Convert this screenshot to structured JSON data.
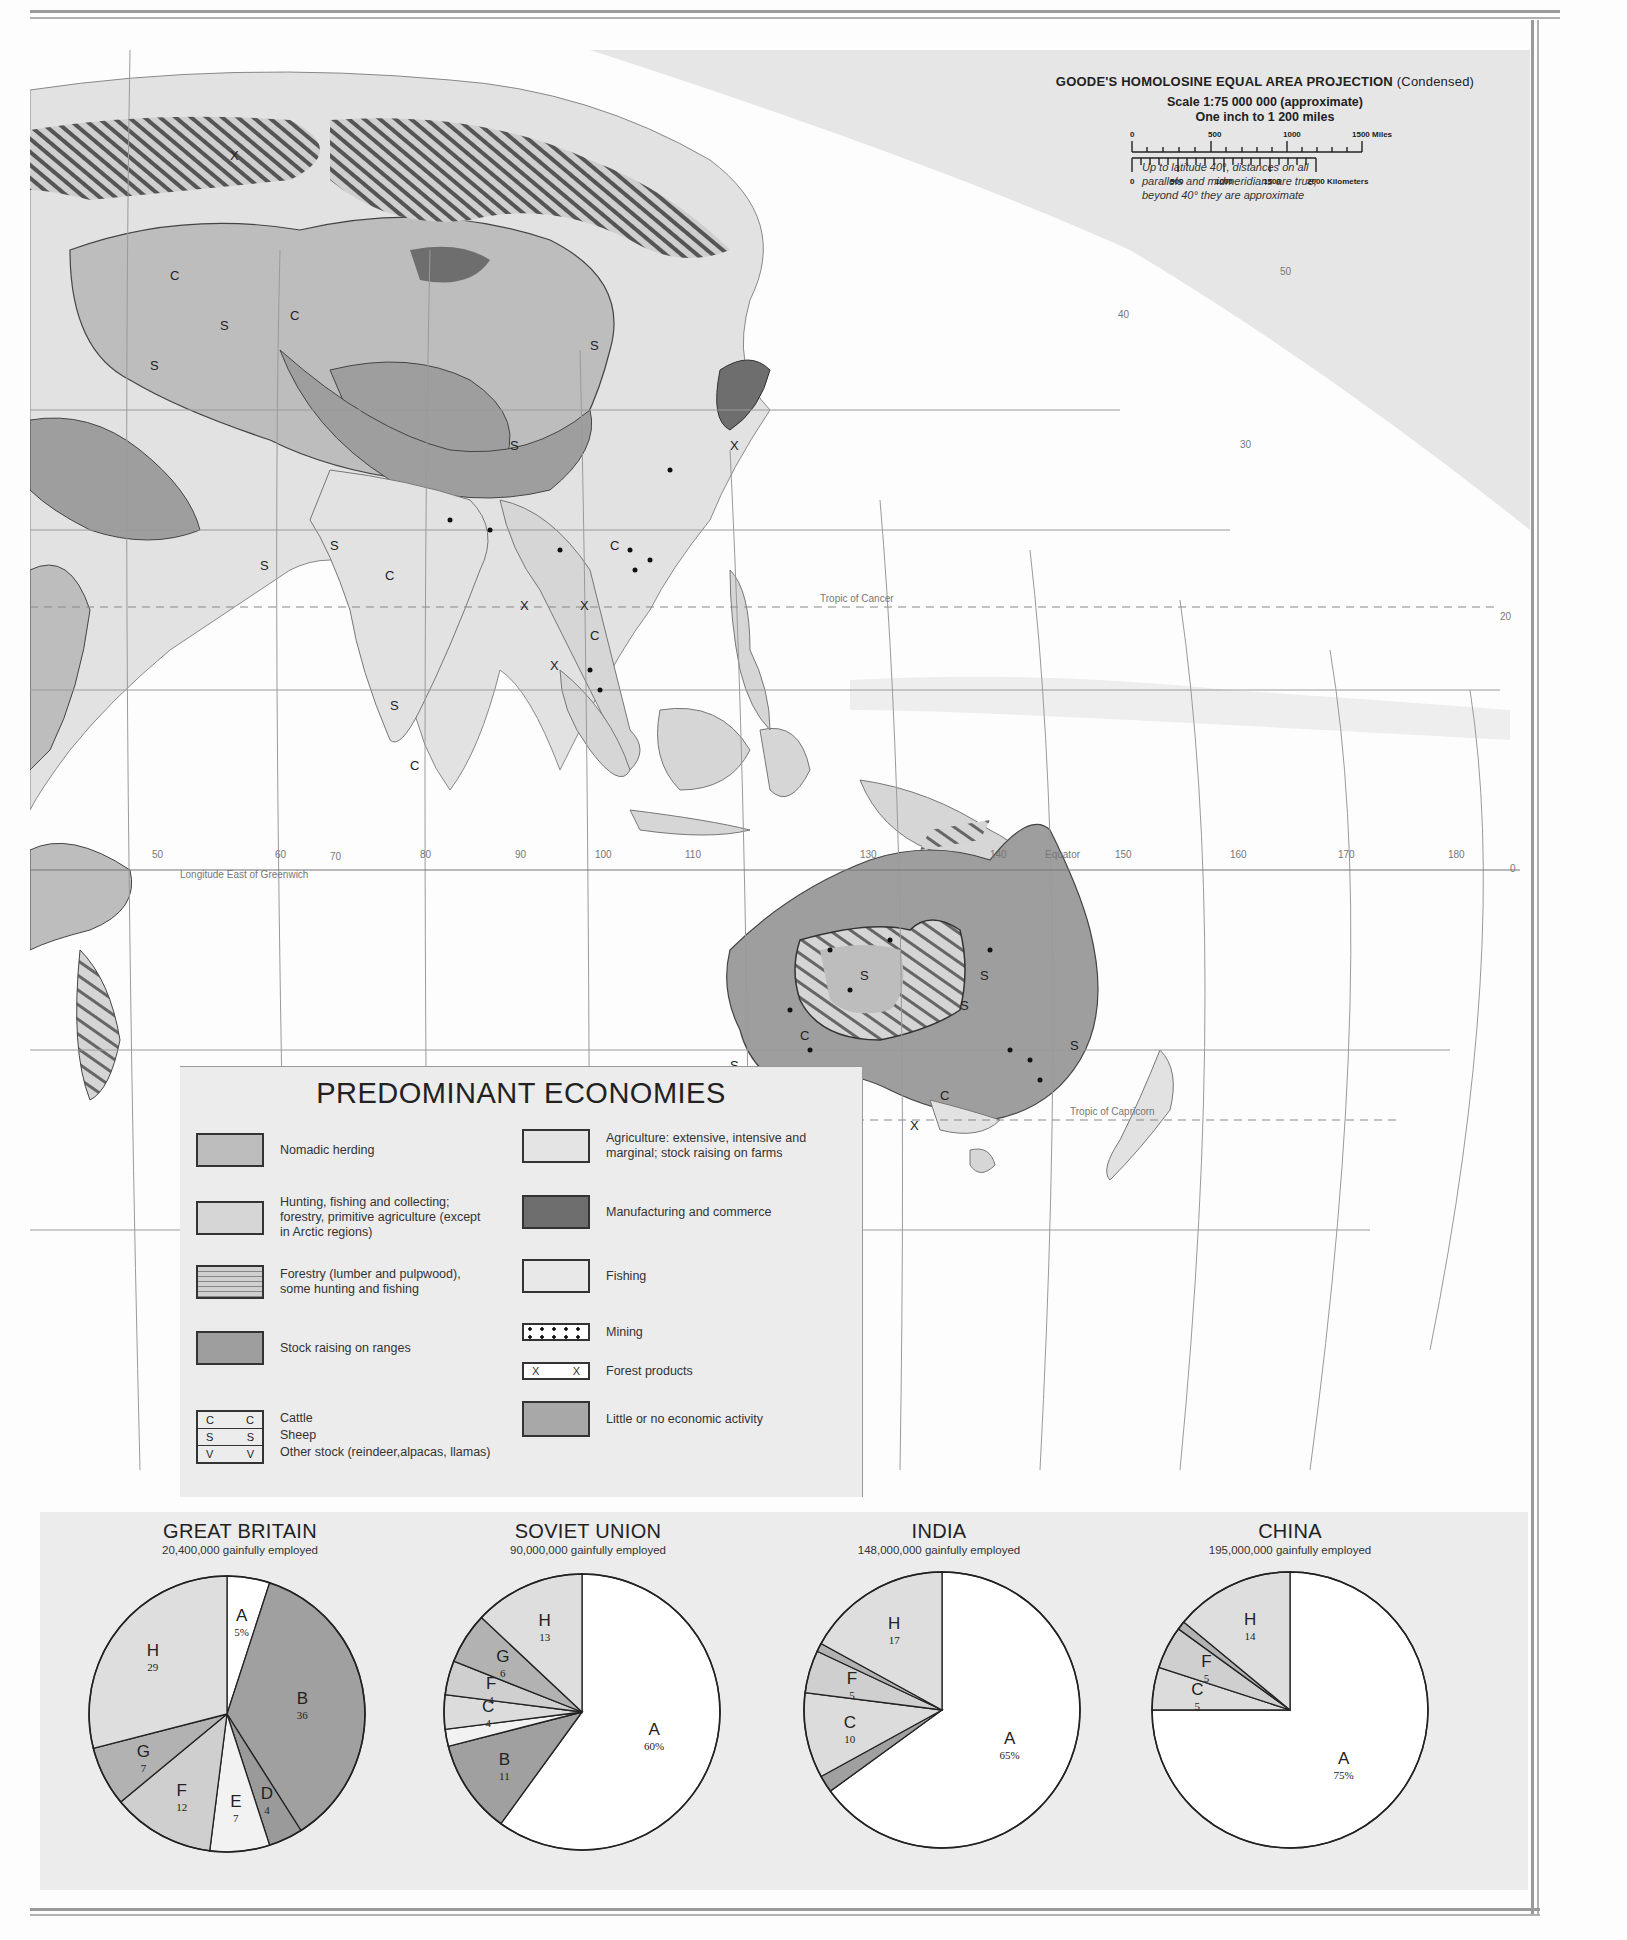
{
  "map": {
    "title": "PREDOMINANT ECONOMIES",
    "projection": {
      "name": "GOODE'S HOMOLOSINE EQUAL AREA PROJECTION",
      "variant": "(Condensed)",
      "scale": "Scale 1:75 000 000 (approximate)",
      "inch": "One inch to 1 200 miles",
      "miles_ticks": [
        "0",
        "500",
        "1000",
        "1500 Miles"
      ],
      "km_ticks": [
        "0",
        "500",
        "1000",
        "1500",
        "2000 Kilometers"
      ],
      "note_lines": [
        "Up to latitude 40°, distances on all",
        "parallels and midmeridians are true;",
        "beyond 40° they are approximate"
      ]
    },
    "grid_labels": {
      "longitude_caption": "Longitude East of Greenwich",
      "longitudes": [
        "40",
        "50",
        "60",
        "70",
        "80",
        "90",
        "100",
        "110",
        "120",
        "130",
        "140",
        "150",
        "160",
        "170",
        "180"
      ],
      "latitudes_right": [
        "50",
        "40",
        "30",
        "20",
        "10",
        "0",
        "10",
        "20",
        "30",
        "40",
        "50"
      ],
      "lat_small": [
        "70",
        "60",
        "50",
        "10"
      ],
      "equator": "Equator",
      "tropic_cancer": "Tropic of Cancer",
      "tropic_capricorn": "Tropic of Capricorn"
    },
    "symbols": {
      "cattle": "C",
      "sheep": "S",
      "other_stock": "V",
      "forest": "X"
    }
  },
  "legend": {
    "title": "PREDOMINANT ECONOMIES",
    "left": [
      {
        "label": "Nomadic herding",
        "fill": "#bdbdbd",
        "pattern": "solid"
      },
      {
        "label": "Hunting, fishing and collecting; forestry, primitive agriculture (except in Arctic regions)",
        "fill": "#d6d6d6",
        "pattern": "solid"
      },
      {
        "label": "Forestry (lumber and pulpwood), some hunting and fishing",
        "fill": "#cfcfcf",
        "pattern": "hlines"
      },
      {
        "label": "Stock raising on ranges",
        "fill": "#9e9e9e",
        "pattern": "solid"
      }
    ],
    "right": [
      {
        "label": "Agriculture: extensive, intensive and marginal; stock raising on farms",
        "fill": "#e4e4e4",
        "pattern": "solid"
      },
      {
        "label": "Manufacturing and commerce",
        "fill": "#6e6e6e",
        "pattern": "solid"
      },
      {
        "label": "Fishing",
        "fill": "#e8e8e8",
        "pattern": "solid"
      },
      {
        "label": "Mining",
        "fill": "#ffffff",
        "pattern": "dots"
      },
      {
        "label": "Forest products",
        "fill": "#ffffff",
        "pattern": "xx"
      },
      {
        "label": "Little or no economic activity",
        "fill": "#a8a8a8",
        "pattern": "solid"
      }
    ],
    "stock": [
      {
        "symbol": "C",
        "label": "Cattle"
      },
      {
        "symbol": "S",
        "label": "Sheep"
      },
      {
        "symbol": "V",
        "label": "Other stock (reindeer,alpacas, llamas)"
      }
    ]
  },
  "chart_data": [
    {
      "type": "pie",
      "title": "GREAT BRITAIN",
      "subtitle": "20,400,000 gainfully employed",
      "categories": [
        "A",
        "B",
        "D",
        "E",
        "F",
        "G",
        "H"
      ],
      "values": [
        5,
        36,
        4,
        7,
        12,
        7,
        29
      ],
      "labels": [
        "A 5%",
        "B 36",
        "D 4",
        "E 7",
        "F 12",
        "G 7",
        "H 29"
      ]
    },
    {
      "type": "pie",
      "title": "SOVIET UNION",
      "subtitle": "90,000,000 gainfully employed",
      "categories": [
        "A",
        "B",
        "E",
        "C",
        "D",
        "F",
        "G",
        "H"
      ],
      "values": [
        60,
        11,
        2,
        4,
        0,
        4,
        6,
        13
      ],
      "labels": [
        "A 60%",
        "B 11",
        "E 2",
        "C 4",
        "",
        "F 4",
        "G 6",
        "H 13"
      ]
    },
    {
      "type": "pie",
      "title": "INDIA",
      "subtitle": "148,000,000 gainfully employed",
      "categories": [
        "A",
        "B",
        "C",
        "F",
        "G",
        "H"
      ],
      "values": [
        65,
        2,
        10,
        5,
        1,
        17
      ],
      "labels": [
        "A 65%",
        "B 2",
        "C 10",
        "F 5",
        "G 1",
        "H 17"
      ]
    },
    {
      "type": "pie",
      "title": "CHINA",
      "subtitle": "195,000,000 gainfully employed",
      "categories": [
        "A",
        "C",
        "F",
        "G",
        "H"
      ],
      "values": [
        75,
        5,
        5,
        1,
        14
      ],
      "labels": [
        "A 75%",
        "C 5",
        "F 5",
        "G 1",
        "H 14"
      ]
    }
  ],
  "colors": {
    "ocean": "#ffffff",
    "land_agri": "#e2e2e2",
    "nomadic": "#bdbdbd",
    "stock": "#9e9e9e",
    "manufacturing": "#6e6e6e",
    "outside_map": "#e6e6e6",
    "grid": "#9a9a9a"
  }
}
